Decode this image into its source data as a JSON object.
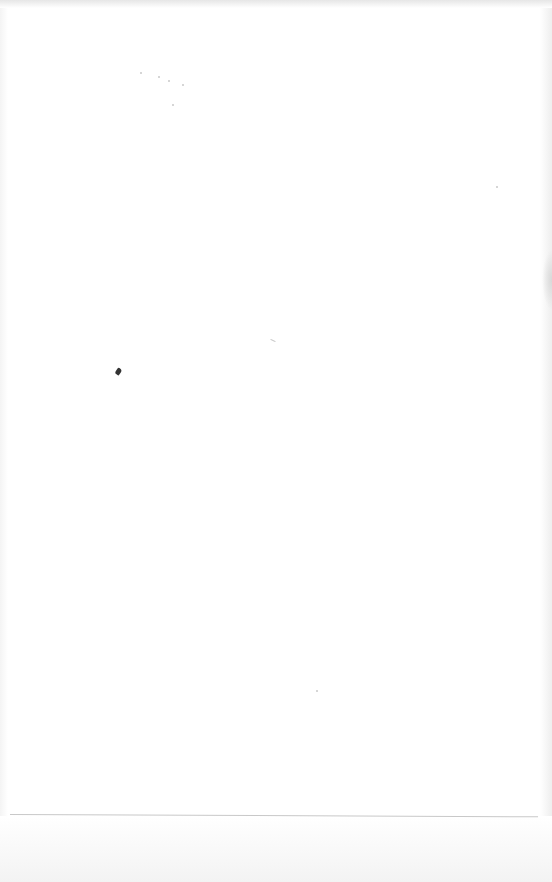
{
  "page": {
    "kind": "blank scanned page",
    "text_content": []
  }
}
